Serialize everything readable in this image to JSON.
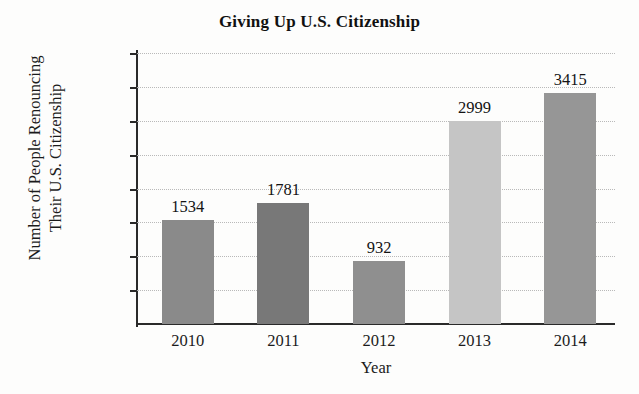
{
  "chart_data": {
    "type": "bar",
    "title": "Giving Up U.S. Citizenship",
    "xlabel": "Year",
    "ylabel": "Number of People Renouncing Their U.S. Citizenship",
    "ylabel_lines": [
      "Number of People Renouncing",
      "Their U.S. Citizenship"
    ],
    "categories": [
      "2010",
      "2011",
      "2012",
      "2013",
      "2014"
    ],
    "values": [
      1534,
      1781,
      932,
      2999,
      3415
    ],
    "value_labels": [
      "1534",
      "1781",
      "932",
      "2999",
      "3415"
    ],
    "bar_colors": [
      "#8a8a8a",
      "#787878",
      "#8f8f8f",
      "#c5c5c5",
      "#969696"
    ],
    "ylim": [
      0,
      4000
    ],
    "ytick_labels": [
      "500",
      "1000",
      "1500",
      "2000",
      "2500",
      "3000",
      "3500",
      "4000"
    ],
    "ytick_values": [
      500,
      1000,
      1500,
      2000,
      2500,
      3000,
      3500,
      4000
    ],
    "grid": true,
    "grid_style": "dotted",
    "grid_color": "#b9b9b9",
    "legend": "none",
    "axis_color": "#2a2a2a",
    "background": "#fdfdfc"
  }
}
